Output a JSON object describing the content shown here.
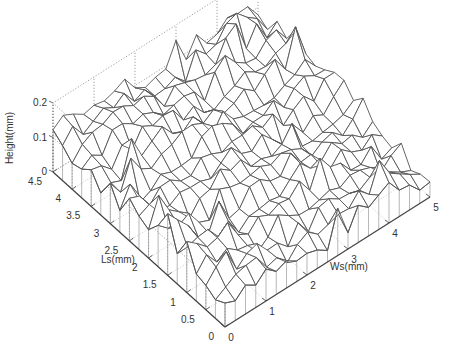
{
  "chart_data": {
    "type": "surface3d",
    "title": "",
    "xlabel": "Ws(mm)",
    "ylabel": "Ls(mm)",
    "zlabel": "Height(mm)",
    "xlim": [
      0,
      5
    ],
    "ylim": [
      0,
      4.5
    ],
    "zlim": [
      0,
      0.2
    ],
    "x_ticks": [
      "0",
      "1",
      "2",
      "3",
      "4",
      "5"
    ],
    "y_ticks": [
      "0",
      "0.5",
      "1",
      "1.5",
      "2",
      "2.5",
      "3",
      "3.5",
      "4",
      "4.5"
    ],
    "z_ticks": [
      "0",
      "0.1",
      "0.2"
    ],
    "grid": true,
    "grid_style": "dotted",
    "surface_style": "wireframe with vertical skirt",
    "grid_x": [
      0,
      0.25,
      0.5,
      0.75,
      1,
      1.25,
      1.5,
      1.75,
      2,
      2.25,
      2.5,
      2.75,
      3,
      3.25,
      3.5,
      3.75,
      4,
      4.25,
      4.5,
      4.75,
      5
    ],
    "grid_y": [
      0,
      0.25,
      0.5,
      0.75,
      1,
      1.25,
      1.5,
      1.75,
      2,
      2.25,
      2.5,
      2.75,
      3,
      3.25,
      3.5,
      3.75,
      4,
      4.25,
      4.5
    ]
  },
  "colors": {
    "mesh": "#555555",
    "skirt": "#9a9a9a",
    "grid": "#777777",
    "axis": "#444444",
    "background": "#ffffff"
  }
}
